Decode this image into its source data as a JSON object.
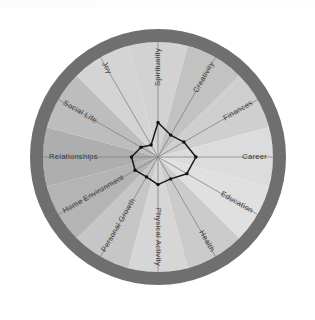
{
  "page": {
    "artifact_text": "· · ·   · ·   · · ·   ·· ·  · ·  ·· ·· ·  · · ·   ·  ·· ·  ·   ·· ·  · ·",
    "background_color": "#ffffff"
  },
  "colors": {
    "outer_ring": "#6f6f6f",
    "spoke": "#7e7e7e",
    "data_line": "#1a1a1a",
    "label_text": "#3a3a3a",
    "segment_light": "#d8d8d8",
    "segment_dark": "#a8a8a8"
  },
  "chart_data": {
    "type": "radar",
    "xlabel": "",
    "ylabel": "",
    "rlim": [
      0,
      10
    ],
    "grid": false,
    "legend": "none",
    "center": {
      "x": 158,
      "y": 150
    },
    "outer_radius": 128,
    "ring_thickness": 13,
    "start_angle_deg": -90,
    "categories": [
      "Spirituality",
      "Creativity",
      "Finances",
      "Career",
      "Education",
      "Health",
      "Physical Activity",
      "Personal Growth",
      "Home Environment",
      "Relationships",
      "Social Life",
      "Joy"
    ],
    "values": [
      3.0,
      2.2,
      2.6,
      3.3,
      2.9,
      2.2,
      2.4,
      2.0,
      2.3,
      2.3,
      1.7,
      1.2
    ],
    "segment_shades": [
      "#d2d2d2",
      "#c2c2c2",
      "#cfcfcf",
      "#dcdcdc",
      "#e0e0e0",
      "#cbcbcb",
      "#d6d6d6",
      "#c6c6c6",
      "#b4b4b4",
      "#aeaeae",
      "#bdbdbd",
      "#d4d4d4"
    ]
  }
}
